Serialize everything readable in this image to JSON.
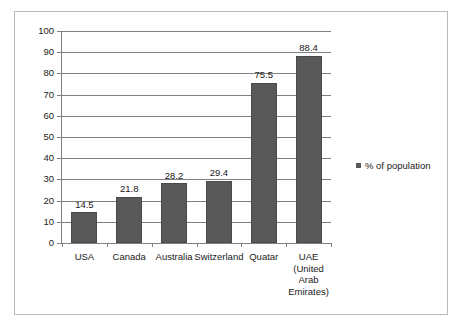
{
  "chart_data": {
    "type": "bar",
    "title": "",
    "subtitle": "",
    "xlabel": "",
    "ylabel": "",
    "categories": [
      "USA",
      "Canada",
      "Australia",
      "Switzerland",
      "Quatar",
      "UAE (United Arab Emirates)"
    ],
    "category_label_lines": [
      [
        "USA"
      ],
      [
        "Canada"
      ],
      [
        "Australia"
      ],
      [
        "Switzerland"
      ],
      [
        "Quatar"
      ],
      [
        "UAE",
        "(United",
        "Arab",
        "Emirates)"
      ]
    ],
    "values": [
      14.5,
      21.8,
      28.2,
      29.4,
      75.5,
      88.4
    ],
    "data_labels": [
      "14.5",
      "21.8",
      "28.2",
      "29.4",
      "75.5",
      "88.4"
    ],
    "series": [
      {
        "name": "% of population",
        "values": [
          14.5,
          21.8,
          28.2,
          29.4,
          75.5,
          88.4
        ],
        "color": "#595959"
      }
    ],
    "ylim": [
      0,
      100
    ],
    "ytick_step": 10,
    "ytick_labels": [
      "100",
      "90",
      "80",
      "70",
      "60",
      "50",
      "40",
      "30",
      "20",
      "10",
      "0"
    ],
    "ytick_values": [
      100,
      90,
      80,
      70,
      60,
      50,
      40,
      30,
      20,
      10,
      0
    ],
    "grid": true,
    "grid_axis": "y",
    "grid_color": "#808080",
    "legend": {
      "position": "right",
      "entries": [
        {
          "label": "% of population",
          "color": "#595959",
          "marker": "square"
        }
      ]
    },
    "border_color": "#b9b9b9",
    "background_color": "#ffffff"
  }
}
